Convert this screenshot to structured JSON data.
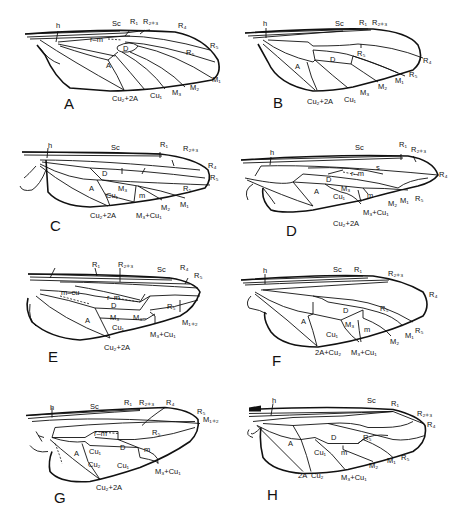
{
  "figure": {
    "type": "insect wing venation diagrams",
    "panels": [
      {
        "letter": "A",
        "labels": {
          "h": "h",
          "sc": "Sc",
          "r1": "R₁",
          "r23": "R₂₊₃",
          "r4": "R₄",
          "r5": "R₅",
          "rm": "r–m",
          "d": "D",
          "rs5": "R₅",
          "a": "A",
          "m1": "M₁",
          "m2": "M₂",
          "m3": "M₃",
          "cu1": "Cu₁",
          "cu2a": "Cu₂+2A"
        }
      },
      {
        "letter": "B",
        "labels": {
          "h": "h",
          "sc": "Sc",
          "r1": "R₁",
          "r23": "R₂₊₃",
          "r4": "R₄",
          "r5": "R₅",
          "rs5": "R₅",
          "d": "D",
          "a": "A",
          "m1": "M₁",
          "m2": "M₂",
          "m3": "M₃",
          "cu1": "Cu₁",
          "cu2a": "Cu₂+2A"
        }
      },
      {
        "letter": "C",
        "labels": {
          "h": "h",
          "sc": "Sc",
          "r1": "R₁",
          "r23": "R₂₊₃",
          "r4": "R₄",
          "r5": "R₅",
          "rs5": "R₅",
          "d": "D",
          "a": "A",
          "m3": "M₃",
          "m": "m",
          "m1": "M₁",
          "m2": "M₂",
          "cu1": "Cu₁",
          "m3cu1": "M₃+Cu₁",
          "cu2a": "Cu₂+2A"
        }
      },
      {
        "letter": "D",
        "labels": {
          "h": "h",
          "sc": "Sc",
          "r1": "R₁",
          "r23": "R₂₊₃",
          "r4": "R₄",
          "r5": "R₅",
          "s": "s",
          "rm": "r–m",
          "d": "D",
          "a": "A",
          "m3": "M₃",
          "m": "m",
          "m1": "M₁",
          "m2": "M₂",
          "cu1": "Cu₁",
          "m3cu1": "M₃+Cu₁",
          "cu2a": "Cu₂+2A"
        }
      },
      {
        "letter": "E",
        "labels": {
          "r1": "R₁",
          "r23": "R₂₊₃",
          "sc": "Sc",
          "r4": "R₄",
          "r5": "R₅",
          "mcu": "m–cu",
          "rm": "r–m",
          "d": "D",
          "rs5": "R₅",
          "a": "A",
          "m3": "M₃",
          "m3b": "M₃–",
          "m12": "M₁₊₂",
          "cu1": "Cu₁",
          "m3cu1": "M₃+Cu₁",
          "cu2a": "Cu₂+2A"
        }
      },
      {
        "letter": "F",
        "labels": {
          "h": "h",
          "sc": "Sc",
          "r1": "R₁",
          "r23": "R₂₊₃",
          "r4": "R₄",
          "r5": "R₅",
          "d": "D",
          "rs5": "R₅",
          "a": "A",
          "m3": "M₃",
          "m": "m",
          "cu1": "Cu₁",
          "m1": "M₁",
          "m2": "M₂",
          "a2cu2": "2A+Cu₂",
          "m3cu1": "M₃+Cu₁"
        }
      },
      {
        "letter": "G",
        "labels": {
          "h": "h",
          "sc": "Sc",
          "r1": "R₁",
          "r23": "R₂₊₃",
          "r4": "R₄",
          "r5": "R₅",
          "m12": "M₁₊₂",
          "rm": "r–m",
          "rs5": "R₅",
          "d": "D",
          "m": "m",
          "a": "A",
          "cu1a": "Cu₁",
          "cu2": "Cu₂",
          "cu1b": "Cu₁",
          "m3cu1": "M₃+Cu₁",
          "cu2a": "Cu₂+2A"
        }
      },
      {
        "letter": "H",
        "labels": {
          "h": "h",
          "sc": "Sc",
          "r1": "R₁",
          "r23": "R₂₊₃",
          "r4": "R₄",
          "d": "D",
          "rs5": "R₅",
          "a": "A",
          "cu1": "Cu₁",
          "m": "m",
          "m1": "M₁",
          "m2": "M₂",
          "r5": "R₅",
          "a2": "2A",
          "cu2": "Cu₂",
          "m3cu1": "M₃+Cu₁"
        }
      }
    ]
  }
}
